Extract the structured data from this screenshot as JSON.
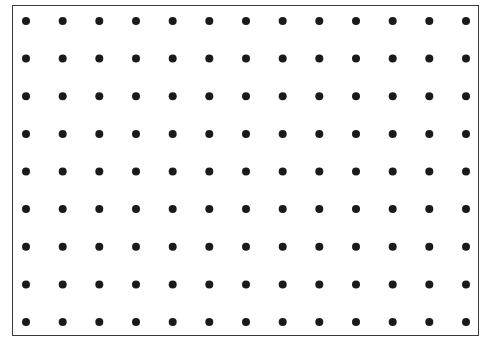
{
  "diagram": {
    "type": "dot-grid",
    "columns": 13,
    "rows": 9,
    "dot_color": "#1a1a1a",
    "border_color": "#3a3a3a",
    "background_color": "#ffffff",
    "first_dot_x": 26,
    "first_dot_y": 21,
    "last_dot_x": 466,
    "last_dot_y": 322,
    "dot_radius": 4
  }
}
